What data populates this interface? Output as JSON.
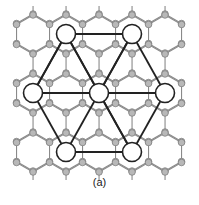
{
  "figure": {
    "label": "(a)",
    "lattice": {
      "type": "honeycomb",
      "hex_orientation": "pointy-top",
      "hex_radius": 19,
      "center_dx": 33,
      "center_dy": 29.5,
      "origin": [
        33,
        34
      ],
      "rows": [
        -1,
        0,
        1,
        2,
        3,
        4,
        5
      ],
      "cols": [
        -1,
        0,
        1,
        2,
        3,
        4,
        5,
        6
      ],
      "clip": [
        6,
        6,
        193,
        172
      ],
      "edge_color": "#8a8a8a",
      "node_fill": "#b8b8b8",
      "node_stroke": "#777777",
      "node_radius": 3.3
    },
    "superlattice": {
      "circle_radius": 9.5,
      "circle_fill": "#ffffff",
      "circle_stroke": "#222222",
      "line_color": "#222222",
      "nodes": [
        {
          "id": "top-left",
          "x": 66,
          "y": 34
        },
        {
          "id": "top-right",
          "x": 132,
          "y": 34
        },
        {
          "id": "left",
          "x": 33,
          "y": 93
        },
        {
          "id": "center",
          "x": 99,
          "y": 93
        },
        {
          "id": "right",
          "x": 165,
          "y": 93
        },
        {
          "id": "bottom-left",
          "x": 66,
          "y": 152
        },
        {
          "id": "bottom-right",
          "x": 132,
          "y": 152
        }
      ],
      "edges": [
        [
          "top-left",
          "top-right"
        ],
        [
          "top-right",
          "right"
        ],
        [
          "right",
          "bottom-right"
        ],
        [
          "bottom-right",
          "bottom-left"
        ],
        [
          "bottom-left",
          "left"
        ],
        [
          "left",
          "top-left"
        ],
        [
          "top-left",
          "bottom-right"
        ],
        [
          "top-right",
          "bottom-left"
        ],
        [
          "left",
          "right"
        ],
        [
          "top-left",
          "center"
        ],
        [
          "center",
          "bottom-right"
        ],
        [
          "top-left",
          "left"
        ],
        [
          "top-right",
          "center"
        ]
      ]
    }
  }
}
